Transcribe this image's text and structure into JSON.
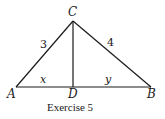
{
  "figure": {
    "caption": "Exercise 5",
    "points": {
      "A": {
        "label": "A",
        "x": 16,
        "y": 87
      },
      "B": {
        "label": "B",
        "x": 151,
        "y": 87
      },
      "C": {
        "label": "C",
        "x": 73,
        "y": 21
      },
      "D": {
        "label": "D",
        "x": 73,
        "y": 87
      }
    },
    "segments": [
      {
        "from": "A",
        "to": "C",
        "label": "3"
      },
      {
        "from": "C",
        "to": "B",
        "label": "4"
      },
      {
        "from": "A",
        "to": "B",
        "label": ""
      },
      {
        "from": "C",
        "to": "D",
        "label": ""
      },
      {
        "from": "A",
        "to": "D",
        "label": "x"
      },
      {
        "from": "D",
        "to": "B",
        "label": "y"
      }
    ],
    "labels": {
      "side_ac": "3",
      "side_cb": "4",
      "seg_ad": "x",
      "seg_db": "y"
    },
    "line_color": "#1a1a1a"
  }
}
